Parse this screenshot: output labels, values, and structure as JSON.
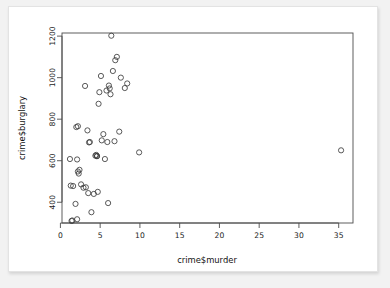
{
  "figure": {
    "kind": "r-base-scatterplot",
    "background_color": "#f2f2f2",
    "canvas_color": "#ffffff",
    "point_color": "#3c3c3c",
    "axis_color": "#4d4d4d"
  },
  "chart_data": {
    "type": "scatter",
    "title": "",
    "xlabel": "crime$murder",
    "ylabel": "crime$burglary",
    "xlim": [
      0.2,
      36.8
    ],
    "ylim": [
      300,
      1215
    ],
    "xticks": [
      0,
      5,
      10,
      15,
      20,
      25,
      30,
      35
    ],
    "xticklabels": [
      "0",
      "5",
      "10",
      "15",
      "20",
      "25",
      "30",
      "35"
    ],
    "yticks": [
      400,
      600,
      800,
      1000,
      1200
    ],
    "yticklabels": [
      "400",
      "600",
      "800",
      "1000",
      "1200"
    ],
    "grid": false,
    "legend": null,
    "marker": "open-circle",
    "marker_size": 2.6,
    "n_points": 51,
    "x": [
      1.2,
      1.3,
      1.4,
      1.5,
      1.6,
      1.9,
      2.0,
      2.1,
      2.1,
      2.2,
      2.2,
      2.3,
      2.4,
      2.6,
      2.9,
      3.1,
      3.2,
      3.4,
      3.5,
      3.6,
      3.7,
      3.9,
      4.2,
      4.4,
      4.5,
      4.6,
      4.6,
      4.7,
      4.8,
      4.9,
      5.1,
      5.2,
      5.4,
      5.6,
      5.8,
      5.9,
      6.0,
      6.1,
      6.2,
      6.3,
      6.4,
      6.6,
      6.8,
      6.9,
      7.1,
      7.4,
      7.6,
      8.1,
      8.4,
      9.9,
      35.3
    ],
    "y": [
      608,
      480,
      310,
      312,
      478,
      392,
      762,
      318,
      606,
      766,
      548,
      538,
      556,
      486,
      470,
      960,
      472,
      746,
      444,
      688,
      690,
      352,
      440,
      624,
      628,
      622,
      622,
      450,
      874,
      930,
      1008,
      698,
      728,
      608,
      938,
      690,
      396,
      962,
      948,
      920,
      1202,
      1032,
      694,
      1084,
      1100,
      740,
      1000,
      950,
      972,
      640,
      650
    ]
  }
}
